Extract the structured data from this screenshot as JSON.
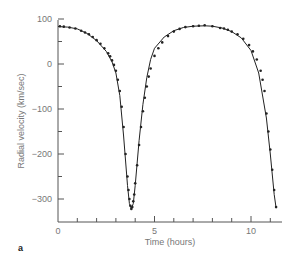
{
  "chart_data": {
    "type": "line",
    "title": "",
    "panel_label": "a",
    "xlabel": "Time (hours)",
    "ylabel": "Radial velocity (km/sec)",
    "xlim": [
      0,
      11.6
    ],
    "ylim": [
      -350,
      100
    ],
    "x_ticks": [
      0,
      5,
      10
    ],
    "x_minor_ticks": [
      1,
      2,
      3,
      4,
      6,
      7,
      8,
      9,
      11
    ],
    "y_ticks": [
      100,
      0,
      -100,
      -200,
      -300
    ],
    "y_minor_ticks": [
      50,
      -50,
      -150,
      -250
    ],
    "grid": false,
    "legend": null,
    "series": [
      {
        "name": "Radial velocity fit",
        "style": "line",
        "x": [
          0,
          0.5,
          1.0,
          1.5,
          2.0,
          2.5,
          2.8,
          3.0,
          3.2,
          3.4,
          3.6,
          3.7,
          3.8,
          3.9,
          4.0,
          4.2,
          4.4,
          4.6,
          4.8,
          5.0,
          5.5,
          6.0,
          6.5,
          7.0,
          7.6,
          8.0,
          8.5,
          9.0,
          9.5,
          10.0,
          10.4,
          10.8,
          11.0,
          11.2,
          11.3
        ],
        "y": [
          83,
          82,
          78,
          68,
          52,
          28,
          5,
          -20,
          -70,
          -160,
          -270,
          -310,
          -322,
          -310,
          -270,
          -170,
          -90,
          -30,
          10,
          35,
          60,
          74,
          81,
          84,
          85,
          84,
          80,
          72,
          58,
          30,
          -20,
          -120,
          -200,
          -290,
          -320
        ]
      },
      {
        "name": "Observations",
        "style": "markers",
        "x": [
          0.1,
          0.3,
          0.6,
          0.9,
          1.2,
          1.4,
          1.6,
          1.8,
          2.0,
          2.2,
          2.4,
          2.6,
          2.7,
          2.8,
          2.9,
          3.0,
          3.1,
          3.2,
          3.3,
          3.4,
          3.5,
          3.6,
          3.65,
          3.7,
          3.75,
          3.8,
          3.85,
          3.9,
          3.95,
          4.0,
          4.1,
          4.2,
          4.3,
          4.4,
          4.5,
          4.6,
          4.7,
          4.8,
          5.0,
          5.2,
          5.4,
          5.7,
          6.0,
          6.3,
          6.6,
          7.0,
          7.3,
          7.6,
          8.0,
          8.4,
          8.6,
          8.8,
          9.0,
          9.3,
          9.6,
          9.9,
          10.1,
          10.3,
          10.5,
          10.6,
          10.7,
          10.8,
          10.9,
          11.0,
          11.1,
          11.2,
          11.3
        ],
        "y": [
          84,
          83,
          81,
          79,
          74,
          70,
          66,
          60,
          53,
          45,
          35,
          24,
          17,
          8,
          -2,
          -15,
          -35,
          -60,
          -95,
          -140,
          -200,
          -250,
          -280,
          -300,
          -315,
          -322,
          -318,
          -305,
          -290,
          -265,
          -225,
          -180,
          -140,
          -105,
          -75,
          -50,
          -28,
          -10,
          18,
          35,
          48,
          62,
          72,
          78,
          82,
          84,
          85,
          86,
          84,
          80,
          79,
          76,
          72,
          66,
          56,
          42,
          28,
          10,
          -15,
          -35,
          -60,
          -110,
          -150,
          -190,
          -235,
          -280,
          -318
        ]
      }
    ]
  }
}
